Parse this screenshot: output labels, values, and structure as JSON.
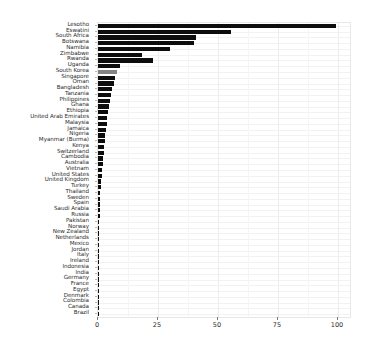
{
  "chart_data": {
    "type": "bar",
    "orientation": "horizontal",
    "title": "",
    "subtitle": "",
    "xlabel": "",
    "ylabel": "",
    "xlim": [
      0,
      105
    ],
    "ylim": null,
    "grid": true,
    "legend": null,
    "legend_position": "none",
    "xticks": [
      0,
      25,
      50,
      75,
      100
    ],
    "xtick_labels": [
      "0",
      "25",
      "50",
      "75",
      "100"
    ],
    "bar_color": "#0d0d0d",
    "highlight_color": "#848484",
    "highlight_category": "South Korea",
    "background_color": "#ffffff",
    "gridline_color": "#ededed",
    "categories": [
      "Lesotho",
      "Eswatini",
      "South Africa",
      "Botswana",
      "Namibia",
      "Zimbabwe",
      "Rwanda",
      "Uganda",
      "South Korea",
      "Singapore",
      "Oman",
      "Bangladesh",
      "Tanzania",
      "Philippines",
      "Ghana",
      "Ethiopia",
      "United Arab Emirates",
      "Malaysia",
      "Jamaica",
      "Nigeria",
      "Myanmar (Burma)",
      "Kenya",
      "Switzerland",
      "Cambodia",
      "Australia",
      "Vietnam",
      "United States",
      "United Kingdom",
      "Turkey",
      "Thailand",
      "Sweden",
      "Spain",
      "Saudi Arabia",
      "Russia",
      "Pakistan",
      "Norway",
      "New Zealand",
      "Netherlands",
      "Mexico",
      "Jordan",
      "Italy",
      "Ireland",
      "Indonesia",
      "India",
      "Germany",
      "France",
      "Egypt",
      "Denmark",
      "Colombia",
      "Canada",
      "Brazil"
    ],
    "values": [
      99.0,
      55.5,
      41.0,
      40.0,
      30.0,
      18.5,
      23.0,
      9.0,
      8.0,
      7.0,
      6.5,
      6.0,
      5.5,
      5.0,
      4.6,
      4.2,
      3.9,
      3.6,
      3.3,
      3.0,
      2.8,
      2.6,
      2.3,
      2.1,
      1.9,
      1.7,
      1.5,
      1.3,
      1.1,
      1.0,
      0.9,
      0.8,
      0.7,
      0.65,
      0.6,
      0.55,
      0.5,
      0.45,
      0.4,
      0.38,
      0.35,
      0.32,
      0.3,
      0.28,
      0.26,
      0.24,
      0.22,
      0.2,
      0.18,
      0.16,
      0.14
    ]
  }
}
